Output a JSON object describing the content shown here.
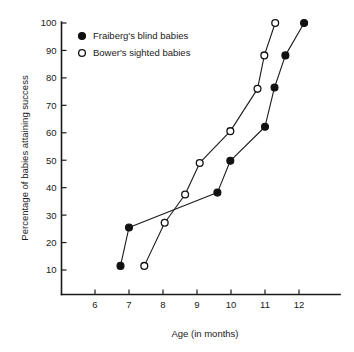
{
  "chart_data": {
    "type": "line",
    "title": "",
    "xlabel": "Age (in months)",
    "ylabel": "Percentage of babies attaining success",
    "xlim": [
      5.3,
      12.9
    ],
    "ylim": [
      5,
      104
    ],
    "grid": false,
    "legend_position": "top-left",
    "xticks": [
      6,
      7,
      8,
      9,
      10,
      11,
      12
    ],
    "xtick_labels": [
      "6",
      "7",
      "8",
      "9",
      "10",
      "11",
      "12"
    ],
    "yticks": [
      10,
      20,
      30,
      40,
      50,
      60,
      70,
      80,
      90,
      100
    ],
    "ytick_labels": [
      "10",
      "20",
      "30",
      "40",
      "50",
      "60",
      "70",
      "80",
      "90",
      "100"
    ],
    "series": [
      {
        "name": "Fraiberg's blind babies",
        "marker": "filled-circle",
        "x": [
          6.75,
          7.0,
          9.6,
          9.98,
          11.0,
          11.28,
          11.6,
          12.15
        ],
        "y": [
          11.5,
          25.5,
          38.2,
          49.8,
          62.2,
          76.5,
          88.2,
          100.0
        ]
      },
      {
        "name": "Bower's sighted babies",
        "marker": "open-circle",
        "x": [
          7.45,
          8.05,
          8.65,
          9.08,
          9.98,
          10.78,
          10.98,
          11.3
        ],
        "y": [
          11.5,
          27.2,
          37.5,
          49.0,
          60.6,
          76.0,
          88.2,
          100.0
        ]
      }
    ]
  },
  "legend": {
    "entries": [
      {
        "label": "Fraiberg's blind babies",
        "marker": "filled-circle"
      },
      {
        "label": "Bower's sighted babies",
        "marker": "open-circle"
      }
    ]
  },
  "axes": {
    "x_title": "Age (in months)",
    "y_title": "Percentage of babies attaining success"
  }
}
